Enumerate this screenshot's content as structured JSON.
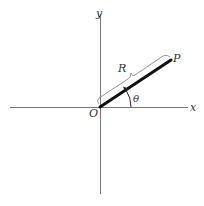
{
  "figure": {
    "axes": {
      "x_label": "x",
      "y_label": "y",
      "origin_label": "O",
      "axis_color": "#777777"
    },
    "vector": {
      "point_label": "P",
      "length_label": "R",
      "angle_label": "θ",
      "vector_color": "#111111",
      "brace_color": "#777777"
    },
    "caption": ""
  }
}
